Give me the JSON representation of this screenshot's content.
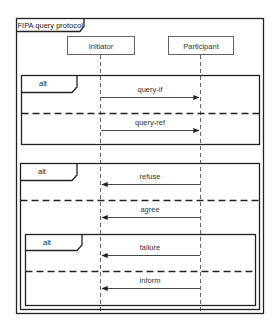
{
  "diagram": {
    "title": "FIPA query protocol",
    "lifelines": [
      {
        "name": "Initiator"
      },
      {
        "name": "Participant"
      }
    ],
    "fragments": [
      {
        "operator": "alt",
        "operands": [
          {
            "messages": [
              {
                "label": "query-if",
                "from": "Initiator",
                "to": "Participant"
              }
            ]
          },
          {
            "messages": [
              {
                "label": "query-ref",
                "from": "Initiator",
                "to": "Participant"
              }
            ]
          }
        ]
      },
      {
        "operator": "alt",
        "operands": [
          {
            "messages": [
              {
                "label": "refuse",
                "from": "Participant",
                "to": "Initiator"
              }
            ]
          },
          {
            "messages": [
              {
                "label": "agree",
                "from": "Participant",
                "to": "Initiator"
              }
            ]
          }
        ],
        "nested": {
          "operator": "alt",
          "operands": [
            {
              "messages": [
                {
                  "label": "failure",
                  "from": "Participant",
                  "to": "Initiator"
                }
              ]
            },
            {
              "messages": [
                {
                  "label": "inform",
                  "from": "Participant",
                  "to": "Initiator"
                }
              ]
            }
          ]
        }
      }
    ]
  },
  "colors": {
    "line": "#222222",
    "lifeline_box_border": "#555555",
    "text": "#333333",
    "background": "#ffffff"
  }
}
